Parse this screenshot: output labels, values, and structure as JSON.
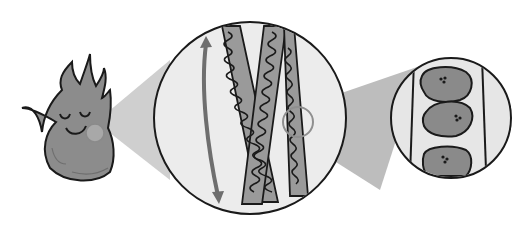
{
  "figure": {
    "width": 517,
    "height": 237,
    "colors": {
      "background": "#ffffff",
      "outline": "#1a1a1a",
      "fill_dark": "#8a8a8a",
      "fill_light": "#e6e6e6",
      "cone": "#c9c9c9",
      "cone_dark": "#a9a9a9",
      "highlight_ring": "#8f8f8f",
      "arrow": "#6e6e6e"
    },
    "panels": [
      {
        "name": "flame-character",
        "label": "",
        "center": [
          88,
          118
        ]
      },
      {
        "name": "strand-magnifier",
        "label": "",
        "center": [
          250,
          118
        ],
        "radius": 96
      },
      {
        "name": "cell-magnifier",
        "label": "",
        "center": [
          451,
          118
        ],
        "radius": 60
      }
    ],
    "icons": {
      "flame": "flame-icon",
      "arrow": "double-arrow-icon",
      "cell": "cell-icon"
    }
  }
}
